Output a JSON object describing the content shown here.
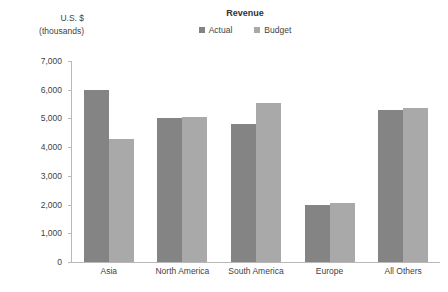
{
  "chart_data": {
    "type": "bar",
    "title": "Revenue",
    "subtitle": "",
    "xlabel": "",
    "ylabel": "U.S. $ (thousands)",
    "ylabel_lines": [
      "U.S. $",
      "(thousands)"
    ],
    "categories": [
      "Asia",
      "North America",
      "South America",
      "Europe",
      "All Others"
    ],
    "series": [
      {
        "name": "Actual",
        "color": "#848484",
        "values": [
          6000,
          5000,
          4800,
          2000,
          5300
        ]
      },
      {
        "name": "Budget",
        "color": "#a9a9a9",
        "values": [
          4300,
          5050,
          5550,
          2050,
          5350
        ]
      }
    ],
    "ylim": [
      0,
      7000
    ],
    "ytick_step": 1000,
    "ytick_labels": [
      "7,000",
      "6,000",
      "5,000",
      "4,000",
      "3,000",
      "2,000",
      "1,000",
      "0"
    ],
    "ytick_values": [
      7000,
      6000,
      5000,
      4000,
      3000,
      2000,
      1000,
      0
    ],
    "grid": false,
    "legend_position": "top-center",
    "axis_color": "#b8b8b8",
    "text_color": "#3f3f3f"
  }
}
